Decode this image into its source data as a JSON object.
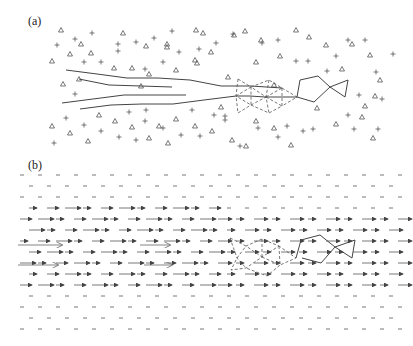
{
  "panels": {
    "a": {
      "label": "(a)"
    },
    "b": {
      "label": "(b)"
    }
  },
  "colors": {
    "ink": "#444444",
    "light": "#888888",
    "bg": "#ffffff"
  },
  "panel_a": {
    "triangles": [
      [
        61,
        30
      ],
      [
        123,
        33
      ],
      [
        81,
        44
      ],
      [
        91,
        53
      ],
      [
        167,
        47
      ],
      [
        70,
        54
      ],
      [
        52,
        61
      ],
      [
        132,
        68
      ],
      [
        114,
        68
      ],
      [
        149,
        74
      ],
      [
        167,
        44
      ],
      [
        196,
        30
      ],
      [
        63,
        84
      ],
      [
        79,
        79
      ],
      [
        141,
        86
      ],
      [
        176,
        70
      ],
      [
        195,
        60
      ],
      [
        99,
        115
      ],
      [
        52,
        126
      ],
      [
        70,
        133
      ],
      [
        115,
        121
      ],
      [
        132,
        127
      ],
      [
        159,
        126
      ],
      [
        176,
        119
      ],
      [
        195,
        126
      ],
      [
        168,
        143
      ],
      [
        88,
        141
      ],
      [
        149,
        138
      ],
      [
        203,
        33
      ],
      [
        245,
        31
      ],
      [
        146,
        46
      ],
      [
        197,
        63
      ],
      [
        211,
        52
      ],
      [
        256,
        62
      ],
      [
        280,
        56
      ],
      [
        296,
        30
      ],
      [
        326,
        45
      ],
      [
        352,
        44
      ],
      [
        342,
        69
      ],
      [
        370,
        55
      ],
      [
        380,
        80
      ],
      [
        221,
        107
      ],
      [
        256,
        121
      ],
      [
        274,
        128
      ],
      [
        317,
        108
      ],
      [
        336,
        124
      ],
      [
        362,
        117
      ],
      [
        365,
        106
      ],
      [
        375,
        96
      ],
      [
        373,
        138
      ],
      [
        246,
        146
      ],
      [
        291,
        145
      ],
      [
        212,
        131
      ],
      [
        232,
        140
      ],
      [
        228,
        77
      ],
      [
        309,
        37
      ],
      [
        261,
        40
      ],
      [
        234,
        35
      ],
      [
        274,
        85
      ]
    ],
    "crosses": [
      [
        92,
        33
      ],
      [
        75,
        39
      ],
      [
        57,
        45
      ],
      [
        118,
        44
      ],
      [
        154,
        38
      ],
      [
        172,
        31
      ],
      [
        136,
        42
      ],
      [
        101,
        62
      ],
      [
        84,
        62
      ],
      [
        118,
        51
      ],
      [
        179,
        52
      ],
      [
        145,
        69
      ],
      [
        163,
        62
      ],
      [
        199,
        49
      ],
      [
        75,
        94
      ],
      [
        66,
        118
      ],
      [
        84,
        125
      ],
      [
        101,
        131
      ],
      [
        119,
        137
      ],
      [
        136,
        140
      ],
      [
        54,
        143
      ],
      [
        145,
        121
      ],
      [
        163,
        128
      ],
      [
        181,
        135
      ],
      [
        129,
        112
      ],
      [
        146,
        110
      ],
      [
        192,
        110
      ],
      [
        216,
        43
      ],
      [
        233,
        34
      ],
      [
        262,
        43
      ],
      [
        278,
        40
      ],
      [
        296,
        61
      ],
      [
        308,
        61
      ],
      [
        327,
        71
      ],
      [
        336,
        56
      ],
      [
        348,
        40
      ],
      [
        365,
        40
      ],
      [
        376,
        72
      ],
      [
        359,
        95
      ],
      [
        348,
        115
      ],
      [
        382,
        99
      ],
      [
        313,
        129
      ],
      [
        287,
        126
      ],
      [
        225,
        120
      ],
      [
        225,
        116
      ],
      [
        278,
        137
      ],
      [
        303,
        131
      ],
      [
        214,
        115
      ],
      [
        200,
        136
      ],
      [
        240,
        146
      ],
      [
        258,
        128
      ],
      [
        354,
        129
      ],
      [
        378,
        129
      ],
      [
        393,
        54
      ]
    ]
  },
  "chart_data": {
    "type": "diagram",
    "title": "",
    "panels": [
      {
        "id": "a",
        "label": "(a)",
        "description": "Scattered point lattice (triangles and crosses) with four solid polyline chains from the left converging into a dashed triangulated cluster, followed by a solid hexagon-like loop and a small triangle on the right."
      },
      {
        "id": "b",
        "label": "(b)",
        "description": "Field of horizontal rightward arrows of varying lengths (larger on the left), with a dashed triangulated cluster and solid polyline loop on the right mirroring panel (a)."
      }
    ]
  }
}
